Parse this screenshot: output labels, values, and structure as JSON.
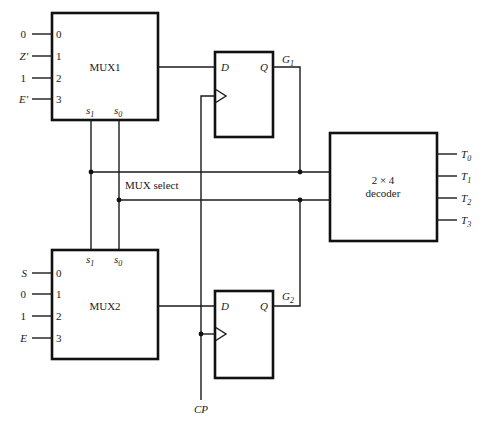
{
  "diagram": {
    "type": "logic-circuit",
    "mux1": {
      "label": "MUX1",
      "inputs": [
        {
          "signal": "0",
          "pin": "0"
        },
        {
          "signal": "Z'",
          "pin": "1"
        },
        {
          "signal": "1",
          "pin": "2"
        },
        {
          "signal": "E'",
          "pin": "3"
        }
      ],
      "select": {
        "s1": "s",
        "s1_sub": "1",
        "s0": "s",
        "s0_sub": "0"
      }
    },
    "mux2": {
      "label": "MUX2",
      "inputs": [
        {
          "signal": "S",
          "pin": "0"
        },
        {
          "signal": "0",
          "pin": "1"
        },
        {
          "signal": "1",
          "pin": "2"
        },
        {
          "signal": "E",
          "pin": "3"
        }
      ],
      "select": {
        "s1": "s",
        "s1_sub": "1",
        "s0": "s",
        "s0_sub": "0"
      }
    },
    "ff1": {
      "d": "D",
      "q": "Q",
      "output": "G",
      "output_sub": "1"
    },
    "ff2": {
      "d": "D",
      "q": "Q",
      "output": "G",
      "output_sub": "2"
    },
    "bus_label": "MUX select",
    "decoder": {
      "line1": "2 × 4",
      "line2": "decoder",
      "outputs": [
        {
          "name": "T",
          "sub": "0"
        },
        {
          "name": "T",
          "sub": "1"
        },
        {
          "name": "T",
          "sub": "2"
        },
        {
          "name": "T",
          "sub": "3"
        }
      ]
    },
    "clock": "CP"
  }
}
